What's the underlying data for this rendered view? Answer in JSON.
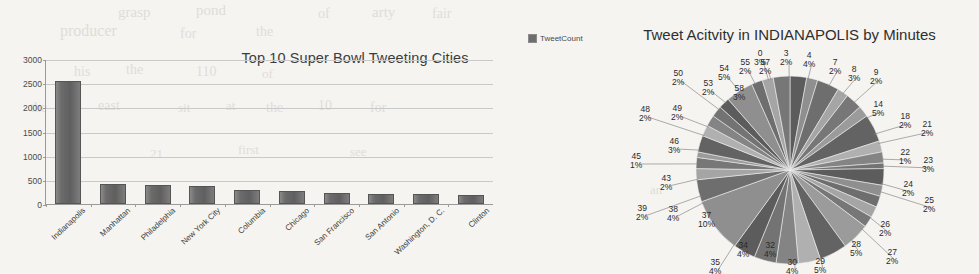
{
  "bar_chart": {
    "legend_label": "TweetCount",
    "legend_swatch_color": "#6e6e6e",
    "title": "Top 10 Super Bowl Tweeting Cities",
    "bar_color": "#6b6b6b"
  },
  "pie_chart": {
    "title": "Tweet Acitvity in INDIANAPOLIS by Minutes"
  },
  "scan_bleed": [
    {
      "text": "grasp",
      "x": 118,
      "y": 4,
      "size": 15
    },
    {
      "text": "pond",
      "x": 196,
      "y": 2,
      "size": 15
    },
    {
      "text": "of",
      "x": 318,
      "y": 6,
      "size": 14
    },
    {
      "text": "arty",
      "x": 372,
      "y": 4,
      "size": 15
    },
    {
      "text": "fair",
      "x": 432,
      "y": 6,
      "size": 14
    },
    {
      "text": "producer",
      "x": 60,
      "y": 22,
      "size": 16
    },
    {
      "text": "for",
      "x": 180,
      "y": 26,
      "size": 14
    },
    {
      "text": "the",
      "x": 256,
      "y": 24,
      "size": 14
    },
    {
      "text": "his",
      "x": 74,
      "y": 64,
      "size": 14
    },
    {
      "text": "the",
      "x": 126,
      "y": 62,
      "size": 14
    },
    {
      "text": "110",
      "x": 196,
      "y": 64,
      "size": 14
    },
    {
      "text": "of",
      "x": 262,
      "y": 66,
      "size": 13
    },
    {
      "text": "the",
      "x": 30,
      "y": 100,
      "size": 14
    },
    {
      "text": "east",
      "x": 98,
      "y": 98,
      "size": 14
    },
    {
      "text": "sit",
      "x": 178,
      "y": 100,
      "size": 13
    },
    {
      "text": "at",
      "x": 226,
      "y": 98,
      "size": 13
    },
    {
      "text": "the",
      "x": 266,
      "y": 100,
      "size": 14
    },
    {
      "text": "10",
      "x": 318,
      "y": 98,
      "size": 14
    },
    {
      "text": "for",
      "x": 370,
      "y": 100,
      "size": 14
    },
    {
      "text": "21",
      "x": 150,
      "y": 146,
      "size": 13
    },
    {
      "text": "first",
      "x": 238,
      "y": 142,
      "size": 13
    },
    {
      "text": "see",
      "x": 350,
      "y": 144,
      "size": 13
    },
    {
      "text": "an",
      "x": 650,
      "y": 182,
      "size": 13
    },
    {
      "text": "11",
      "x": 716,
      "y": 186,
      "size": 13
    }
  ],
  "chart_data": [
    {
      "type": "bar",
      "title": "Top 10 Super Bowl Tweeting Cities",
      "xlabel": "",
      "ylabel": "",
      "ylim": [
        0,
        3000
      ],
      "yticks": [
        0,
        500,
        1000,
        1500,
        2000,
        2500,
        3000
      ],
      "grid": true,
      "legend": [
        "TweetCount"
      ],
      "legend_position": "top-right",
      "categories": [
        "Indianapolis",
        "Manhattan",
        "Philadelphia",
        "New York City",
        "Columbia",
        "Chicago",
        "San Francisco",
        "San Antonio",
        "Washington, D. C.",
        "Clinton"
      ],
      "series": [
        {
          "name": "TweetCount",
          "values": [
            2550,
            420,
            400,
            370,
            280,
            260,
            235,
            215,
            200,
            180
          ]
        }
      ]
    },
    {
      "type": "pie",
      "title": "Tweet Acitvity in INDIANAPOLIS by Minutes",
      "labels_are_minutes": true,
      "start_angle_deg": 0,
      "direction": "clockwise",
      "slices": [
        {
          "label": "0",
          "pct": 3,
          "lx": 763,
          "ly": 57,
          "inside": false
        },
        {
          "label": "3",
          "pct": 2,
          "lx": 789,
          "ly": 57,
          "inside": false
        },
        {
          "label": "4",
          "pct": 4,
          "lx": 812,
          "ly": 59,
          "inside": false
        },
        {
          "label": "7",
          "pct": 2,
          "lx": 838,
          "ly": 66,
          "inside": false
        },
        {
          "label": "8",
          "pct": 3,
          "lx": 857,
          "ly": 73,
          "inside": false
        },
        {
          "label": "9",
          "pct": 2,
          "lx": 879,
          "ly": 76,
          "inside": false
        },
        {
          "label": "14",
          "pct": 5,
          "lx": 881,
          "ly": 108,
          "inside": false
        },
        {
          "label": "18",
          "pct": 2,
          "lx": 908,
          "ly": 120,
          "inside": false
        },
        {
          "label": "21",
          "pct": 2,
          "lx": 930,
          "ly": 128,
          "inside": false
        },
        {
          "label": "22",
          "pct": 1,
          "lx": 908,
          "ly": 156,
          "inside": false
        },
        {
          "label": "23",
          "pct": 3,
          "lx": 931,
          "ly": 164,
          "inside": false
        },
        {
          "label": "24",
          "pct": 2,
          "lx": 911,
          "ly": 188,
          "inside": false
        },
        {
          "label": "25",
          "pct": 2,
          "lx": 932,
          "ly": 204,
          "inside": false
        },
        {
          "label": "26",
          "pct": 2,
          "lx": 888,
          "ly": 228,
          "inside": false
        },
        {
          "label": "27",
          "pct": 2,
          "lx": 895,
          "ly": 256,
          "inside": false
        },
        {
          "label": "28",
          "pct": 5,
          "lx": 859,
          "ly": 248,
          "inside": false
        },
        {
          "label": "29",
          "pct": 5,
          "lx": 823,
          "ly": 265,
          "inside": false
        },
        {
          "label": "30",
          "pct": 4,
          "lx": 795,
          "ly": 266,
          "inside": false
        },
        {
          "label": "32",
          "pct": 4,
          "lx": 773,
          "ly": 249,
          "inside": true
        },
        {
          "label": "34",
          "pct": 4,
          "lx": 746,
          "ly": 249,
          "inside": true
        },
        {
          "label": "35",
          "pct": 4,
          "lx": 718,
          "ly": 266,
          "inside": false
        },
        {
          "label": "37",
          "pct": 10,
          "lx": 707,
          "ly": 219,
          "inside": true
        },
        {
          "label": "38",
          "pct": 4,
          "lx": 676,
          "ly": 213,
          "inside": false
        },
        {
          "label": "39",
          "pct": 2,
          "lx": 645,
          "ly": 212,
          "inside": false
        },
        {
          "label": "43",
          "pct": 2,
          "lx": 669,
          "ly": 182,
          "inside": false
        },
        {
          "label": "45",
          "pct": 1,
          "lx": 639,
          "ly": 160,
          "inside": false
        },
        {
          "label": "46",
          "pct": 3,
          "lx": 677,
          "ly": 145,
          "inside": false
        },
        {
          "label": "48",
          "pct": 2,
          "lx": 648,
          "ly": 113,
          "inside": false
        },
        {
          "label": "49",
          "pct": 2,
          "lx": 680,
          "ly": 112,
          "inside": false
        },
        {
          "label": "50",
          "pct": 2,
          "lx": 681,
          "ly": 77,
          "inside": false
        },
        {
          "label": "53",
          "pct": 2,
          "lx": 711,
          "ly": 87,
          "inside": false
        },
        {
          "label": "54",
          "pct": 5,
          "lx": 727,
          "ly": 72,
          "inside": false
        },
        {
          "label": "55",
          "pct": 2,
          "lx": 748,
          "ly": 66,
          "inside": false
        },
        {
          "label": "57",
          "pct": 2,
          "lx": 768,
          "ly": 66,
          "inside": false
        },
        {
          "label": "58",
          "pct": 3,
          "lx": 742,
          "ly": 92,
          "inside": true
        }
      ]
    }
  ]
}
